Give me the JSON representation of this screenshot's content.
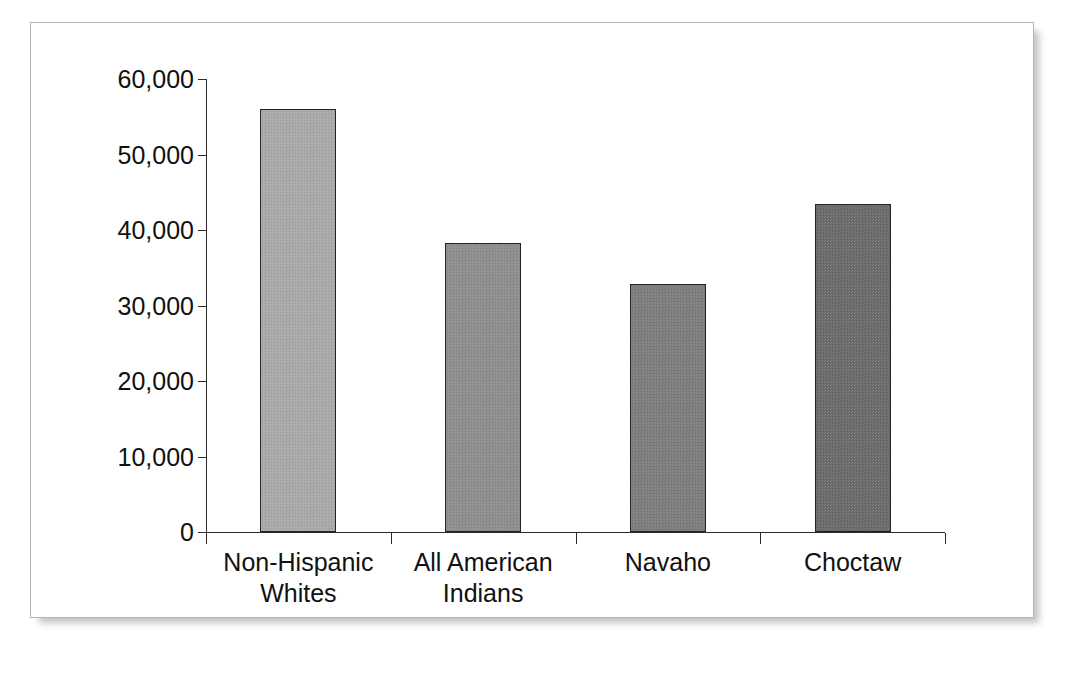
{
  "figure": {
    "frame_border_color": "#b4b4b4",
    "background": "#ffffff"
  },
  "chart_data": {
    "type": "bar",
    "title": "",
    "xlabel": "",
    "ylabel": "",
    "categories": [
      "Non-Hispanic\nWhites",
      "All American\nIndians",
      "Navaho",
      "Choctaw"
    ],
    "values": [
      56000,
      38300,
      32800,
      43400
    ],
    "ylim": [
      0,
      60000
    ],
    "ytick_values": [
      0,
      10000,
      20000,
      30000,
      40000,
      50000,
      60000
    ],
    "ytick_labels": [
      "0",
      "10,000",
      "20,000",
      "30,000",
      "40,000",
      "50,000",
      "60,000"
    ],
    "grid": false,
    "legend": false,
    "bar_colors": [
      "#aaaaaa",
      "#8e8e8e",
      "#7d7d7d",
      "#6b6b6b"
    ],
    "bar_border_color": "#242424",
    "axis_color": "#2b2b2b"
  }
}
